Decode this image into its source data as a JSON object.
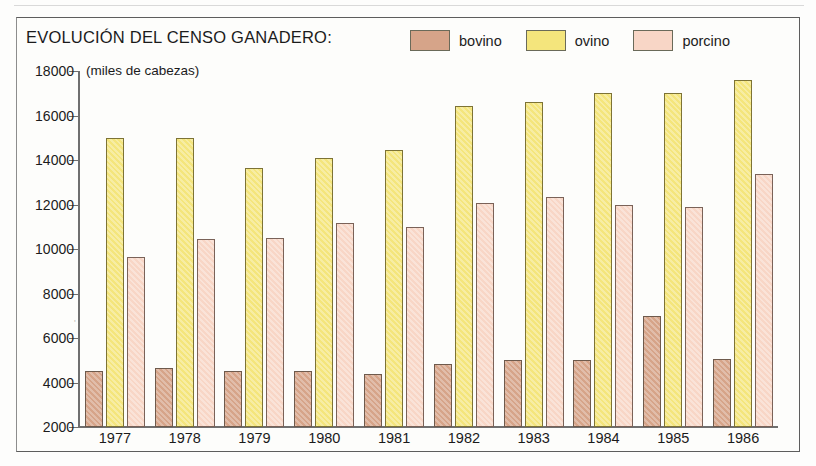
{
  "figure": {
    "title": "EVOLUCIÓN DEL CENSO GANADERO:",
    "unit_note": "(miles de cabezas)"
  },
  "legend": {
    "items": [
      {
        "label": "bovino",
        "color": "#d6a489"
      },
      {
        "label": "ovino",
        "color": "#f4e57c"
      },
      {
        "label": "porcino",
        "color": "#f8d6c6"
      }
    ]
  },
  "axis": {
    "yticks": [
      "18000",
      "16000",
      "14000",
      "12000",
      "10000",
      "8000",
      "6000",
      "4000",
      "2000"
    ]
  },
  "chart_data": {
    "type": "bar",
    "title": "EVOLUCIÓN DEL CENSO GANADERO:",
    "xlabel": "",
    "ylabel": "(miles de cabezas)",
    "ylim": [
      2000,
      18000
    ],
    "ytick_step": 2000,
    "grid": false,
    "legend_position": "top-right",
    "categories": [
      "1977",
      "1978",
      "1979",
      "1980",
      "1981",
      "1982",
      "1983",
      "1984",
      "1985",
      "1986"
    ],
    "series": [
      {
        "name": "bovino",
        "color": "#d6a489",
        "values": [
          4500,
          4650,
          4520,
          4500,
          4400,
          4850,
          5000,
          5000,
          7000,
          5050
        ]
      },
      {
        "name": "ovino",
        "color": "#f4e57c",
        "values": [
          15000,
          15000,
          13650,
          14100,
          14450,
          16450,
          16600,
          17000,
          17000,
          17600
        ]
      },
      {
        "name": "porcino",
        "color": "#f8d6c6",
        "values": [
          9650,
          10450,
          10500,
          11150,
          11000,
          12050,
          12350,
          12000,
          11900,
          13350
        ]
      }
    ]
  }
}
